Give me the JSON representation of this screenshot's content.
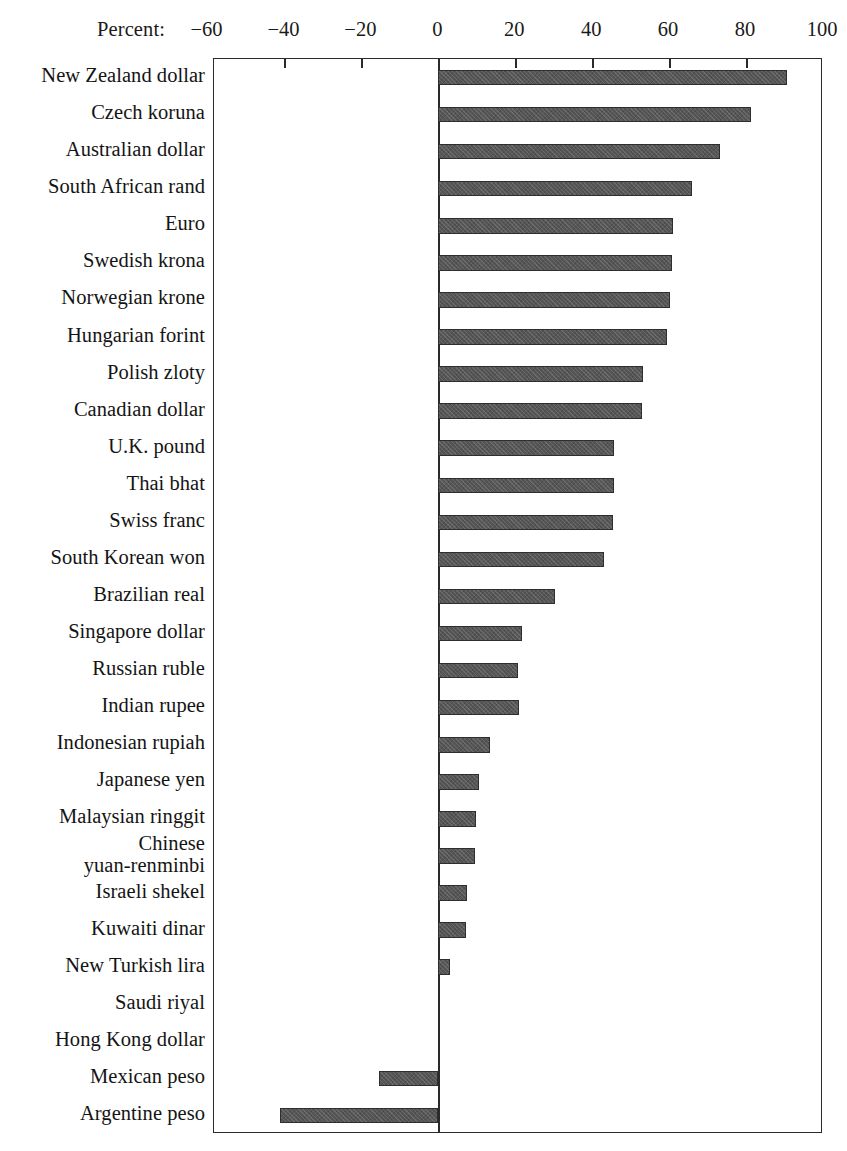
{
  "chart_data": {
    "type": "bar",
    "orientation": "horizontal",
    "title": "",
    "axis_label": "Percent:",
    "xlabel": "Percent",
    "ylabel": "",
    "xlim": [
      -58,
      100
    ],
    "xticks": [
      -60,
      -40,
      -20,
      0,
      20,
      40,
      60,
      80,
      100
    ],
    "xticklabels": [
      "−60",
      "−40",
      "−20",
      "0",
      "20",
      "40",
      "60",
      "80",
      "100"
    ],
    "grid": false,
    "legend": null,
    "bar_color": "#565656",
    "frame_color": "#2a2a2a",
    "categories": [
      "New Zealand dollar",
      "Czech koruna",
      "Australian dollar",
      "South African rand",
      "Euro",
      "Swedish krona",
      "Norwegian krone",
      "Hungarian forint",
      "Polish zloty",
      "Canadian dollar",
      "U.K. pound",
      "Thai bhat",
      "Swiss franc",
      "South Korean won",
      "Brazilian real",
      "Singapore dollar",
      "Russian ruble",
      "Indian rupee",
      "Indonesian rupiah",
      "Japanese yen",
      "Malaysian ringgit",
      "Chinese\nyuan-renminbi",
      "Israeli shekel",
      "Kuwaiti dinar",
      "New Turkish lira",
      "Saudi riyal",
      "Hong Kong dollar",
      "Mexican peso",
      "Argentine peso"
    ],
    "values": [
      90.6,
      81.2,
      73.3,
      65.9,
      61.1,
      60.8,
      60.1,
      59.5,
      53.3,
      52.9,
      45.7,
      45.6,
      45.5,
      43.2,
      30.3,
      21.8,
      20.8,
      21.1,
      13.4,
      10.7,
      9.8,
      9.5,
      7.5,
      7.2,
      3.1,
      0.0,
      0.0,
      -15.3,
      -41.1
    ]
  }
}
